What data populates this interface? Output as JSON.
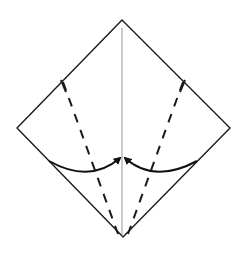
{
  "diagram": {
    "type": "origami-fold-step",
    "description": "Square paper in diamond orientation; fold left and right lower edges to the center crease along dashed valley-fold lines",
    "canvas": {
      "width": 243,
      "height": 259,
      "background": "#ffffff"
    },
    "colors": {
      "outline": "#1a1a1a",
      "crease": "#8a8a8a",
      "fold_line": "#1a1a1a",
      "arrow": "#111111"
    },
    "square": {
      "top": [
        122,
        20
      ],
      "right": [
        230,
        128
      ],
      "bottom": [
        123,
        237
      ],
      "left": [
        17,
        128
      ]
    },
    "center_crease": {
      "from": [
        122,
        28
      ],
      "to": [
        122,
        237
      ]
    },
    "valley_folds": [
      {
        "name": "left-valley-fold",
        "from": [
          63,
          82
        ],
        "to": [
          118,
          234
        ]
      },
      {
        "name": "right-valley-fold",
        "from": [
          183,
          82
        ],
        "to": [
          128,
          234
        ]
      }
    ],
    "fold_arrows": [
      {
        "name": "left-fold-arrow",
        "start": [
          49,
          161
        ],
        "control": [
          90,
          184
        ],
        "end": [
          120,
          158
        ]
      },
      {
        "name": "right-fold-arrow",
        "start": [
          197,
          161
        ],
        "control": [
          154,
          184
        ],
        "end": [
          125,
          158
        ]
      }
    ],
    "labels": []
  }
}
